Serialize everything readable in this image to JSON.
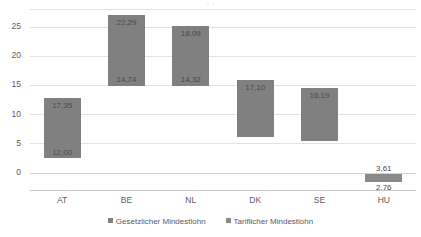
{
  "chart_data": {
    "type": "bar",
    "subtype": "floating-range-bar",
    "title": "",
    "xlabel": "",
    "ylabel": "",
    "categories": [
      "AT",
      "BE",
      "NL",
      "DK",
      "SE",
      "HU"
    ],
    "ylim": [
      -3,
      28
    ],
    "yticks": [
      "0",
      "5",
      "10",
      "15",
      "20",
      "25"
    ],
    "ytick_values": [
      0,
      5,
      10,
      15,
      20,
      25
    ],
    "grid": true,
    "legend_position": "bottom",
    "legend": [
      "Gesetzlicher Mindestlohn",
      "Tariflicher Mindestlohn"
    ],
    "series": [
      {
        "name": "Gesetzlicher Mindestlohn",
        "values": [
          12.0,
          9.38,
          9.53,
          null,
          null,
          2.76
        ],
        "labels": [
          "12,00",
          "9,38",
          "9,53",
          "",
          "",
          "2,76"
        ]
      },
      {
        "name": "Tariflicher Mindestlohn",
        "values": [
          17.35,
          22.29,
          18.09,
          17.1,
          16.19,
          3.61
        ],
        "labels": [
          "17,35",
          "22,29",
          "18,09",
          "17,10",
          "16,19",
          "3,61"
        ]
      }
    ],
    "bars": [
      {
        "category": "AT",
        "top_label": "17,35",
        "bottom_label": "12,00",
        "bar_top_value": 12.7,
        "bar_bottom_value": 2.4,
        "top_label_placement": "inside-top",
        "bottom_label_placement": "inside-bottom"
      },
      {
        "category": "BE",
        "top_label": "22,29",
        "bottom_label": "14,74",
        "bar_top_value": 27.0,
        "bar_bottom_value": 14.8,
        "top_label_placement": "inside-top",
        "bottom_label_placement": "inside-bottom"
      },
      {
        "category": "NL",
        "top_label": "18,09",
        "bottom_label": "14,32",
        "bar_top_value": 25.1,
        "bar_bottom_value": 14.8,
        "top_label_placement": "inside-top",
        "bottom_label_placement": "inside-bottom"
      },
      {
        "category": "DK",
        "top_label": "17,10",
        "bottom_label": "",
        "bar_top_value": 15.9,
        "bar_bottom_value": 6.1,
        "top_label_placement": "inside-top",
        "bottom_label_placement": "none"
      },
      {
        "category": "SE",
        "top_label": "16,19",
        "bottom_label": "",
        "bar_top_value": 14.4,
        "bar_bottom_value": 5.3,
        "top_label_placement": "inside-top",
        "bottom_label_placement": "none"
      },
      {
        "category": "HU",
        "top_label": "3,61",
        "bottom_label": "2,76",
        "bar_top_value": -0.3,
        "bar_bottom_value": -1.6,
        "top_label_placement": "outside-above",
        "bottom_label_placement": "outside-below"
      }
    ]
  },
  "colors": {
    "bar_fill": "#808080",
    "bar_fill_secondary": "#8a8a8a",
    "gridline": "#e2e2e2",
    "axis_line": "#c9c9c9",
    "text": "#5a5a5a",
    "label_text": "#4a4a4a",
    "background": "#ffffff"
  },
  "title_remnant": "· ·"
}
